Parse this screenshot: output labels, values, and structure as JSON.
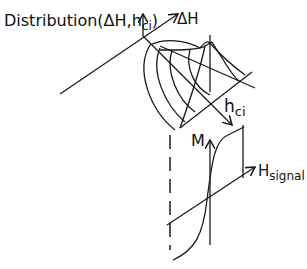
{
  "diagram": {
    "labels": {
      "distribution": "Distribution(",
      "distribution_args": "ΔH,h",
      "distribution_sub": "ci",
      "distribution_close": ")",
      "delta_h": "ΔH",
      "hci_main": "h",
      "hci_sub": "ci",
      "m_axis": "M",
      "hsignal_main": "H",
      "hsignal_sub": "signal"
    },
    "colors": {
      "stroke": "#1a1a1a",
      "background": "#ffffff"
    }
  }
}
